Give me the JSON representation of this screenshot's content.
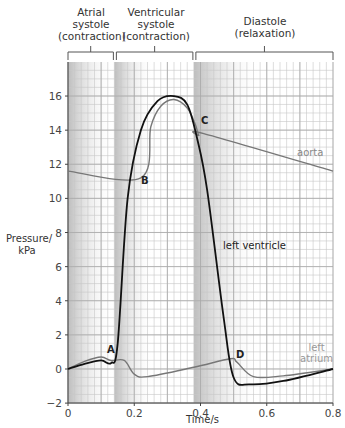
{
  "chart_data": {
    "type": "line",
    "title": "",
    "xlabel": "Time/s",
    "ylabel": "Pressure/ kPa",
    "xlim": [
      0,
      0.8
    ],
    "ylim": [
      -2,
      17.5
    ],
    "xticks": [
      "0",
      "0.2",
      "0.4",
      "0.6",
      "0.8"
    ],
    "yticks": [
      "-2",
      "0",
      "2",
      "4",
      "6",
      "8",
      "10",
      "12",
      "14",
      "16"
    ],
    "grid": true,
    "phases": [
      {
        "label_line1": "Atrial",
        "label_line2": "systole",
        "label_line3": "(contraction)",
        "start": 0,
        "end": 0.14
      },
      {
        "label_line1": "Ventricular",
        "label_line2": "systole",
        "label_line3": "(contraction)",
        "start": 0.14,
        "end": 0.38
      },
      {
        "label_line1": "Diastole",
        "label_line2": "(relaxation)",
        "label_line3": "",
        "start": 0.38,
        "end": 0.8
      }
    ],
    "series": [
      {
        "name": "left ventricle",
        "color": "#111111",
        "x": [
          0,
          0.05,
          0.1,
          0.13,
          0.15,
          0.18,
          0.22,
          0.27,
          0.32,
          0.36,
          0.39,
          0.42,
          0.47,
          0.5,
          0.55,
          0.65,
          0.8
        ],
        "values": [
          0,
          0.3,
          0.5,
          0.35,
          1.5,
          10,
          14,
          15.7,
          16,
          15.5,
          13.5,
          10.5,
          3,
          -0.5,
          -0.9,
          -0.7,
          0
        ]
      },
      {
        "name": "aorta",
        "color": "#777777",
        "x": [
          0,
          0.22,
          0.25,
          0.28,
          0.32,
          0.36,
          0.385,
          0.395,
          0.41,
          0.8
        ],
        "values": [
          11.6,
          11.2,
          14.2,
          15.4,
          15.8,
          15.3,
          14.3,
          13.7,
          13.8,
          11.6
        ]
      },
      {
        "name": "left atrium",
        "color": "#777777",
        "x": [
          0,
          0.05,
          0.1,
          0.13,
          0.17,
          0.2,
          0.24,
          0.38,
          0.49,
          0.51,
          0.56,
          0.65,
          0.8
        ],
        "values": [
          0,
          0.45,
          0.7,
          0.5,
          0.5,
          -0.3,
          -0.45,
          0.1,
          0.6,
          0.4,
          -0.45,
          -0.4,
          0
        ]
      }
    ],
    "annotations": [
      {
        "text": "A",
        "x": 0.13,
        "y": 0.8
      },
      {
        "text": "B",
        "x": 0.225,
        "y": 10.6
      },
      {
        "text": "C",
        "x": 0.405,
        "y": 14.6
      },
      {
        "text": "D",
        "x": 0.51,
        "y": 0.7
      }
    ]
  },
  "labels": {
    "phase1_l1": "Atrial",
    "phase1_l2": "systole",
    "phase1_l3": "(contraction)",
    "phase2_l1": "Ventricular",
    "phase2_l2": "systole",
    "phase2_l3": "(contraction)",
    "phase3_l1": "Diastole",
    "phase3_l2": "(relaxation)",
    "ylabel_l1": "Pressure/",
    "ylabel_l2": "kPa",
    "xlabel": "Time/s",
    "aorta": "aorta",
    "left_ventricle": "left ventricle",
    "left_atrium_l1": "left",
    "left_atrium_l2": "atrium",
    "A": "A",
    "B": "B",
    "C": "C",
    "D": "D"
  }
}
